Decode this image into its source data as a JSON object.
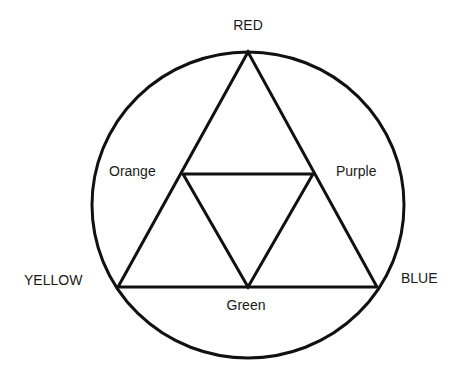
{
  "diagram": {
    "stroke_color": "#111111",
    "background": "#ffffff",
    "primary_colors": [
      {
        "key": "red",
        "label": "RED",
        "position": "top"
      },
      {
        "key": "yellow",
        "label": "YELLOW",
        "position": "bottom-left"
      },
      {
        "key": "blue",
        "label": "BLUE",
        "position": "bottom-right"
      }
    ],
    "secondary_colors": [
      {
        "key": "orange",
        "label": "Orange",
        "between": [
          "RED",
          "YELLOW"
        ]
      },
      {
        "key": "purple",
        "label": "Purple",
        "between": [
          "RED",
          "BLUE"
        ]
      },
      {
        "key": "green",
        "label": "Green",
        "between": [
          "YELLOW",
          "BLUE"
        ]
      }
    ],
    "shapes": {
      "circle": {
        "cx": 248,
        "cy": 205,
        "rx": 156,
        "ry": 153
      },
      "outer_triangle": [
        [
          248,
          52
        ],
        [
          118,
          287
        ],
        [
          377,
          287
        ]
      ],
      "inner_triangle": [
        [
          183,
          174
        ],
        [
          313,
          174
        ],
        [
          248,
          287
        ]
      ]
    }
  }
}
